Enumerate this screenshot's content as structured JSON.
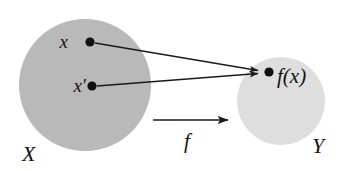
{
  "figure": {
    "type": "function-mapping-diagram",
    "background_color": "#ffffff",
    "domain_set": {
      "label": "X",
      "fill_color": "#b9b9b9",
      "shape": "circle",
      "center": [
        85,
        85
      ],
      "radius": 66,
      "label_position": [
        22,
        160
      ]
    },
    "codomain_set": {
      "label": "Y",
      "fill_color": "#dedede",
      "shape": "circle",
      "center": [
        281,
        101
      ],
      "radius": 44,
      "label_position": [
        312,
        152
      ]
    },
    "points": [
      {
        "id": "point-x",
        "label": "x",
        "dot_position": [
          90,
          42
        ],
        "dot_radius": 4.6,
        "label_position": [
          68,
          48
        ],
        "dot_color": "#111111"
      },
      {
        "id": "point-x-prime",
        "label": "x′",
        "dot_position": [
          92,
          86
        ],
        "dot_radius": 4.6,
        "label_position": [
          63,
          92
        ],
        "dot_color": "#111111"
      },
      {
        "id": "point-fx",
        "label": "f(x)",
        "dot_position": [
          269,
          72
        ],
        "dot_radius": 4.6,
        "label_position": [
          277,
          83
        ],
        "dot_color": "#111111"
      }
    ],
    "arrows": [
      {
        "id": "arrow-x-to-fx",
        "from": [
          95,
          43
        ],
        "to": [
          262,
          71
        ],
        "color": "#1a1a1a",
        "stroke_width": 1.4
      },
      {
        "id": "arrow-x-prime-to-fx",
        "from": [
          97,
          86
        ],
        "to": [
          262,
          73
        ],
        "color": "#1a1a1a",
        "stroke_width": 1.4
      },
      {
        "id": "arrow-map-f",
        "from": [
          153,
          120
        ],
        "to": [
          233,
          120
        ],
        "color": "#1a1a1a",
        "stroke_width": 1.7
      }
    ],
    "map_label": {
      "label": "f",
      "position": [
        187,
        147
      ]
    }
  }
}
